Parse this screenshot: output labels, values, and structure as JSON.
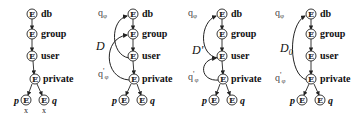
{
  "diagram": {
    "node_symbol": "E",
    "node_labels": [
      "db",
      "group",
      "user",
      "private"
    ],
    "leaf_labels": [
      "p",
      "q"
    ],
    "leaf_marks": [
      "x",
      "x"
    ],
    "panels": [
      {
        "id": "panel-1",
        "query_labels": {
          "q_top": "",
          "q_bottom": ""
        },
        "arc_label": "",
        "arc_label_sub": "",
        "leaf_marks_visible": true
      },
      {
        "id": "panel-2",
        "query_labels": {
          "q_top": "qφ",
          "q_bottom": "q'φ"
        },
        "arc_label": "D",
        "arc_label_sub": "",
        "arcs": [
          "user→db",
          "private→group"
        ]
      },
      {
        "id": "panel-3",
        "query_labels": {
          "q_top": "qφ",
          "q_bottom": "q'φ"
        },
        "arc_label": "D'",
        "arc_label_sub": "",
        "arcs": [
          "user→db",
          "private→user"
        ]
      },
      {
        "id": "panel-4",
        "query_labels": {
          "q_top": "qφ",
          "q_bottom": "q'φ"
        },
        "arc_label": "D",
        "arc_label_sub": "0",
        "arcs": [
          "private→db"
        ]
      }
    ]
  },
  "text": {
    "E": "E",
    "db": "db",
    "group": "group",
    "user": "user",
    "private": "private",
    "p": "p",
    "q": "q",
    "x": "x",
    "q_top": "q",
    "q_top_sub": "φ",
    "q_bot": "q",
    "q_bot_prime": "'",
    "q_bot_sub": "φ",
    "D": "D",
    "D_prime": "D'",
    "D0": "D",
    "D0_sub": "0"
  }
}
